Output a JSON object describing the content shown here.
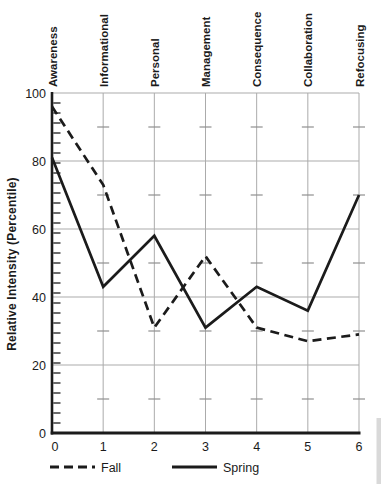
{
  "chart_data": {
    "type": "line",
    "title": "",
    "ylabel": "Relative Intensity (Percentile)",
    "xlabel": "",
    "categories": [
      "Awareness",
      "Informational",
      "Personal",
      "Management",
      "Consequence",
      "Collaboration",
      "Refocusing"
    ],
    "x": [
      0,
      1,
      2,
      3,
      4,
      5,
      6
    ],
    "x_tick_labels": [
      "0",
      "1",
      "2",
      "3",
      "4",
      "5",
      "6"
    ],
    "ylim": [
      0,
      100
    ],
    "y_ticks": [
      0,
      20,
      40,
      60,
      80,
      100
    ],
    "y_tick_labels": [
      "0",
      "20",
      "40",
      "60",
      "80",
      "100"
    ],
    "y_minor_levels": [
      10,
      30,
      50,
      70,
      90
    ],
    "grid": true,
    "legend_position": "bottom",
    "series": [
      {
        "name": "Fall",
        "line_style": "dashed",
        "values": [
          96,
          73,
          31,
          52,
          31,
          27,
          29
        ]
      },
      {
        "name": "Spring",
        "line_style": "solid",
        "values": [
          81,
          43,
          58,
          31,
          43,
          36,
          70
        ]
      }
    ],
    "colors": {
      "ink": "#1b1b1b",
      "grid": "#ababab"
    }
  }
}
